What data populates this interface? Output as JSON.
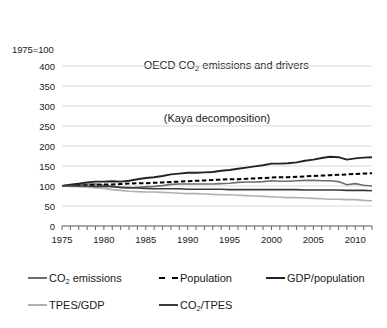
{
  "chart_data": {
    "type": "line",
    "title_line1": "OECD CO2 emissions and drivers",
    "title_line2": "(Kaya decomposition)",
    "index_note": "1975=100",
    "xlabel": "",
    "ylabel": "1975=100",
    "xlim": [
      1975,
      2012
    ],
    "ylim": [
      0,
      400
    ],
    "ytick_step": 50,
    "grid": true,
    "legend_position": "below",
    "yticks": [
      "0",
      "50",
      "100",
      "150",
      "200",
      "250",
      "300",
      "350",
      "400"
    ],
    "xticks": [
      "1975",
      "1980",
      "1985",
      "1990",
      "1995",
      "2000",
      "2005",
      "2010"
    ],
    "x": [
      1975,
      1976,
      1977,
      1978,
      1979,
      1980,
      1981,
      1982,
      1983,
      1984,
      1985,
      1986,
      1987,
      1988,
      1989,
      1990,
      1991,
      1992,
      1993,
      1994,
      1995,
      1996,
      1997,
      1998,
      1999,
      2000,
      2001,
      2002,
      2003,
      2004,
      2005,
      2006,
      2007,
      2008,
      2009,
      2010,
      2011,
      2012
    ],
    "series": [
      {
        "name": "CO2 emissions",
        "label": "CO2 emissions",
        "color": "#6e6e6e",
        "style": "solid",
        "width": 1.6,
        "values": [
          100,
          103,
          104,
          105,
          105,
          102,
          99,
          96,
          95,
          97,
          98,
          99,
          101,
          104,
          105,
          105,
          105,
          105,
          105,
          106,
          107,
          109,
          110,
          110,
          111,
          113,
          112,
          112,
          113,
          114,
          114,
          113,
          113,
          111,
          103,
          106,
          102,
          100
        ]
      },
      {
        "name": "Population",
        "label": "Population",
        "color": "#000000",
        "style": "dashed",
        "width": 2.0,
        "values": [
          100,
          101,
          101,
          102,
          103,
          104,
          104,
          105,
          106,
          107,
          107,
          108,
          109,
          110,
          111,
          112,
          113,
          114,
          115,
          116,
          117,
          117,
          118,
          119,
          120,
          121,
          122,
          122,
          123,
          124,
          125,
          126,
          127,
          128,
          129,
          130,
          131,
          132
        ]
      },
      {
        "name": "GDP/population",
        "label": "GDP/population",
        "color": "#242424",
        "style": "solid",
        "width": 1.9,
        "values": [
          100,
          103,
          106,
          109,
          111,
          111,
          112,
          111,
          113,
          117,
          120,
          122,
          125,
          129,
          131,
          133,
          133,
          134,
          135,
          138,
          140,
          143,
          146,
          149,
          152,
          156,
          156,
          157,
          159,
          163,
          166,
          170,
          173,
          172,
          166,
          169,
          171,
          172
        ]
      },
      {
        "name": "TPES/GDP",
        "label": "TPES/GDP",
        "color": "#b0b0b0",
        "style": "solid",
        "width": 1.6,
        "values": [
          100,
          99,
          98,
          97,
          96,
          94,
          91,
          89,
          87,
          86,
          85,
          85,
          84,
          83,
          82,
          81,
          81,
          80,
          79,
          78,
          78,
          77,
          76,
          75,
          74,
          73,
          72,
          71,
          71,
          70,
          69,
          68,
          67,
          67,
          66,
          66,
          64,
          63
        ]
      },
      {
        "name": "CO2/TPES",
        "label": "CO2/TPES",
        "color": "#3a3a3a",
        "style": "solid",
        "width": 1.6,
        "values": [
          100,
          100,
          100,
          100,
          99,
          99,
          98,
          97,
          96,
          95,
          94,
          93,
          93,
          93,
          93,
          92,
          92,
          92,
          92,
          92,
          91,
          91,
          91,
          91,
          91,
          91,
          91,
          91,
          91,
          90,
          90,
          90,
          90,
          90,
          89,
          89,
          89,
          88
        ]
      }
    ],
    "legend": [
      {
        "label": "CO2 emissions",
        "color": "#6e6e6e",
        "style": "solid"
      },
      {
        "label": "Population",
        "color": "#000000",
        "style": "dashed"
      },
      {
        "label": "GDP/population",
        "color": "#242424",
        "style": "solid"
      },
      {
        "label": "TPES/GDP",
        "color": "#b0b0b0",
        "style": "solid"
      },
      {
        "label": "CO2/TPES",
        "color": "#3a3a3a",
        "style": "solid"
      }
    ]
  }
}
